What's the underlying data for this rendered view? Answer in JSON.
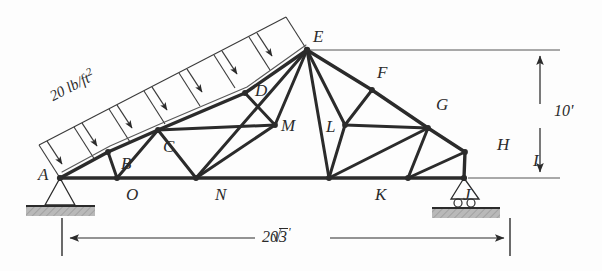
{
  "figure": {
    "kind": "truss-free-body-diagram",
    "background_color": "#fdfdfd",
    "line_color": "#2b2b2b"
  },
  "load": {
    "magnitude": "20",
    "unit": "lb/ft",
    "exponent": "2",
    "label": "20 lb/ft2",
    "arrow_count": 7,
    "applied_to": "left-top-chord",
    "direction": "perpendicular-downward"
  },
  "dimensions": {
    "height": {
      "label": "10'",
      "orientation": "vertical",
      "position": "right"
    },
    "span": {
      "label": "20√3 '",
      "number": "20",
      "radical": "√",
      "radicand": "3",
      "prime": "'",
      "orientation": "horizontal",
      "position": "bottom"
    }
  },
  "supports": [
    {
      "node": "A",
      "type": "pin",
      "ground": "hatched"
    },
    {
      "node": "I",
      "type": "roller",
      "ground": "hatched",
      "rollers": 2
    }
  ],
  "nodes": [
    {
      "id": "A",
      "label": "A",
      "x": 60,
      "y": 178,
      "lx": 38,
      "ly": 168,
      "chord": "bottom"
    },
    {
      "id": "O",
      "label": "O",
      "x": 117,
      "y": 178,
      "lx": 126,
      "ly": 188,
      "chord": "bottom"
    },
    {
      "id": "N",
      "label": "N",
      "x": 196,
      "y": 178,
      "lx": 215,
      "ly": 188,
      "chord": "bottom"
    },
    {
      "id": "K",
      "label": "K",
      "x": 329,
      "y": 178,
      "lx": 375,
      "ly": 188,
      "chord": "bottom"
    },
    {
      "id": "J",
      "label": "J",
      "x": 408,
      "y": 178,
      "lx": 463,
      "ly": 188,
      "chord": "bottom"
    },
    {
      "id": "I",
      "label": "I",
      "x": 464,
      "y": 178,
      "lx": 532,
      "ly": 160,
      "chord": "bottom"
    },
    {
      "id": "B",
      "label": "B",
      "x": 108,
      "y": 152,
      "lx": 122,
      "ly": 158,
      "chord": "left-top"
    },
    {
      "id": "C",
      "label": "C",
      "x": 158,
      "y": 130,
      "lx": 164,
      "ly": 140,
      "chord": "left-top"
    },
    {
      "id": "D",
      "label": "D",
      "x": 245,
      "y": 93,
      "lx": 255,
      "ly": 84,
      "chord": "left-top"
    },
    {
      "id": "E",
      "label": "E",
      "x": 307,
      "y": 50,
      "lx": 313,
      "ly": 30,
      "chord": "apex"
    },
    {
      "id": "F",
      "label": "F",
      "x": 372,
      "y": 90,
      "lx": 377,
      "ly": 66,
      "chord": "right-top"
    },
    {
      "id": "G",
      "label": "G",
      "x": 428,
      "y": 128,
      "lx": 436,
      "ly": 98,
      "chord": "right-top"
    },
    {
      "id": "H",
      "label": "H",
      "x": 465,
      "y": 152,
      "lx": 497,
      "ly": 140,
      "chord": "right-top"
    },
    {
      "id": "M",
      "label": "M",
      "x": 275,
      "y": 125,
      "lx": 278,
      "ly": 118,
      "chord": "interior"
    },
    {
      "id": "L",
      "label": "L",
      "x": 345,
      "y": 125,
      "lx": 327,
      "ly": 120,
      "chord": "interior"
    }
  ],
  "members": [
    {
      "from": "A",
      "to": "O",
      "group": "bottom-chord"
    },
    {
      "from": "O",
      "to": "N",
      "group": "bottom-chord"
    },
    {
      "from": "N",
      "to": "K",
      "group": "bottom-chord"
    },
    {
      "from": "K",
      "to": "J",
      "group": "bottom-chord"
    },
    {
      "from": "J",
      "to": "I",
      "group": "bottom-chord"
    },
    {
      "from": "A",
      "to": "B",
      "group": "left-top-chord"
    },
    {
      "from": "B",
      "to": "C",
      "group": "left-top-chord"
    },
    {
      "from": "C",
      "to": "D",
      "group": "left-top-chord"
    },
    {
      "from": "D",
      "to": "E",
      "group": "left-top-chord"
    },
    {
      "from": "E",
      "to": "F",
      "group": "right-top-chord"
    },
    {
      "from": "F",
      "to": "G",
      "group": "right-top-chord"
    },
    {
      "from": "G",
      "to": "H",
      "group": "right-top-chord"
    },
    {
      "from": "H",
      "to": "I",
      "group": "right-top-chord"
    },
    {
      "from": "B",
      "to": "O",
      "group": "web"
    },
    {
      "from": "C",
      "to": "O",
      "group": "web"
    },
    {
      "from": "C",
      "to": "N",
      "group": "web"
    },
    {
      "from": "C",
      "to": "M",
      "group": "web"
    },
    {
      "from": "D",
      "to": "M",
      "group": "web"
    },
    {
      "from": "M",
      "to": "N",
      "group": "web"
    },
    {
      "from": "M",
      "to": "E",
      "group": "web"
    },
    {
      "from": "E",
      "to": "N",
      "group": "web"
    },
    {
      "from": "E",
      "to": "K",
      "group": "web"
    },
    {
      "from": "E",
      "to": "L",
      "group": "web"
    },
    {
      "from": "L",
      "to": "K",
      "group": "web"
    },
    {
      "from": "L",
      "to": "F",
      "group": "web"
    },
    {
      "from": "L",
      "to": "G",
      "group": "web"
    },
    {
      "from": "G",
      "to": "K",
      "group": "web"
    },
    {
      "from": "G",
      "to": "J",
      "group": "web"
    },
    {
      "from": "H",
      "to": "J",
      "group": "web"
    }
  ],
  "annotations": {
    "apex_extension_line": {
      "from_node": "E",
      "to_x": 560,
      "purpose": "dimension-extension"
    },
    "base_extension_line": {
      "from_node": "I",
      "to_x": 560,
      "purpose": "dimension-extension"
    }
  }
}
